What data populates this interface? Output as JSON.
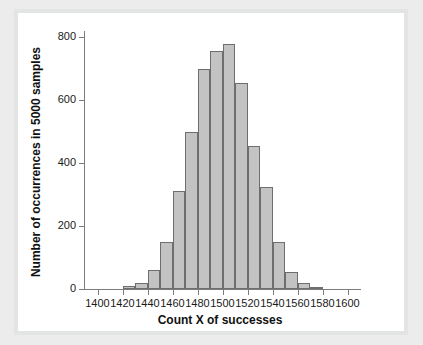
{
  "figure": {
    "background_color": "#ececec",
    "canvas_color": "#ffffff",
    "frame_color": "#e3e4e4"
  },
  "chart_data": {
    "type": "bar",
    "title": "",
    "subtitle": "",
    "xlabel": "Count X of successes",
    "ylabel": "Number of occurrences in 5000 samples",
    "xlim": [
      1390,
      1610
    ],
    "ylim": [
      0,
      820
    ],
    "xticks": [
      1400,
      1420,
      1440,
      1460,
      1480,
      1500,
      1520,
      1540,
      1560,
      1580,
      1600
    ],
    "xtick_labels": [
      "1400",
      "1420",
      "1440",
      "1460",
      "1480",
      "1500",
      "1520",
      "1540",
      "1560",
      "1580",
      "1600"
    ],
    "yticks": [
      0,
      200,
      400,
      600,
      800
    ],
    "ytick_labels": [
      "0",
      "200",
      "400",
      "600",
      "800"
    ],
    "grid": false,
    "legend": null,
    "bin_width": 10,
    "bin_starts": [
      1420,
      1430,
      1440,
      1450,
      1460,
      1470,
      1480,
      1490,
      1500,
      1510,
      1520,
      1530,
      1540,
      1550,
      1560,
      1570
    ],
    "categories": [
      "1420-1430",
      "1430-1440",
      "1440-1450",
      "1450-1460",
      "1460-1470",
      "1470-1480",
      "1480-1490",
      "1490-1500",
      "1500-1510",
      "1510-1520",
      "1520-1530",
      "1530-1540",
      "1540-1550",
      "1550-1560",
      "1560-1570",
      "1570-1580"
    ],
    "values": [
      10,
      20,
      60,
      150,
      310,
      500,
      700,
      755,
      780,
      655,
      455,
      325,
      150,
      55,
      20,
      5
    ],
    "bar_fill_color": "#c3c3c3",
    "bar_edge_color": "#6e6e6e",
    "total_samples": 5000
  }
}
